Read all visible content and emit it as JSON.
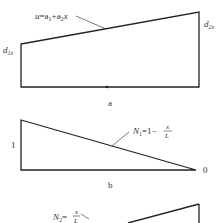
{
  "panels": [
    {
      "id": "a",
      "caption": "a",
      "shape": "trapezoid",
      "equation": {
        "lhs": "u",
        "rhs": "a1 + a2 x",
        "text": "u=a1+a2x"
      },
      "left_label": "d1x",
      "right_label": "d2x"
    },
    {
      "id": "b",
      "caption": "b",
      "shape": "triangle-descending",
      "equation": {
        "lhs": "N1",
        "rhs": "1 - x/L",
        "text": "N1=1-x/L"
      },
      "left_value": "1",
      "right_value": "0"
    },
    {
      "id": "c",
      "shape": "triangle-ascending",
      "equation": {
        "lhs": "N2",
        "rhs": "x/L",
        "text": "N2=x/L"
      }
    }
  ],
  "text": {
    "a_caption": "a",
    "b_caption": "b",
    "u": "u",
    "eq_a_mid": "=a",
    "sub1": "1",
    "plus_a": "+a",
    "sub2": "2",
    "x": "x",
    "d": "d",
    "sub1x": "1x",
    "sub2x": "2x",
    "N": "N",
    "eq_one_minus": "=1−",
    "eq": "=",
    "frac_num": "x",
    "frac_den": "L",
    "one": "1",
    "zero": "0"
  },
  "colors": {
    "line": "#222222",
    "text": "#333333",
    "background": "#ffffff"
  }
}
